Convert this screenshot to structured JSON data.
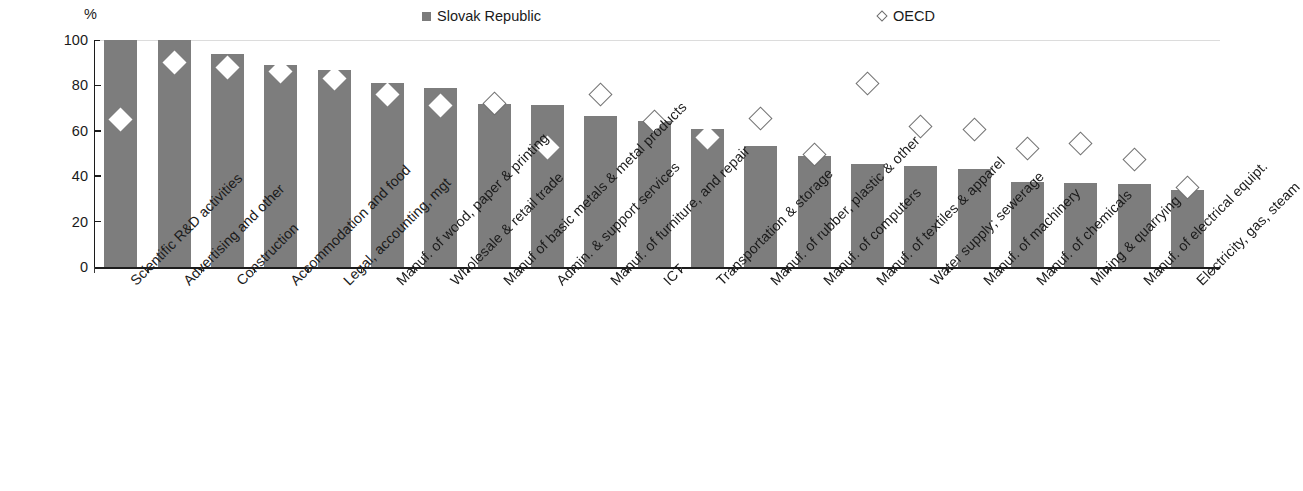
{
  "unit_label": "%",
  "legend": {
    "series1": "Slovak Republic",
    "series2": "OECD"
  },
  "colors": {
    "bar": "#7d7d7d",
    "marker_fill": "#ffffff",
    "marker_stroke": "#6a6a6a",
    "axis": "#1c1c1c",
    "grid": "#dcdcdc"
  },
  "chart_data": {
    "type": "bar",
    "title": "",
    "subtitle": "",
    "xlabel": "",
    "ylabel": "%",
    "ylim": [
      0,
      100
    ],
    "yticks": [
      0,
      20,
      40,
      60,
      80,
      100
    ],
    "grid": true,
    "legend_position": "top",
    "categories": [
      "Scientific R&D activities",
      "Advertising and other",
      "Construction",
      "Accommodation and food",
      "Legal, accounting, mgt",
      "Manuf. of wood, paper & printing",
      "Wholesale & retail trade",
      "Manuf of basic metals & metal products",
      "Admin. & support services",
      "Manuf. of furniture, and repair",
      "ICT",
      "Transportation & storage",
      "Manuf. of rubber, plastic & other",
      "Manuf. of computers",
      "Manuf. of textiles & apparel",
      "Water supply; sewerage",
      "Manuf. of machinery",
      "Manuf. of chemicals",
      "Mining & quarrying",
      "Manuf. of electrical equipt.",
      "Electricity, gas, steam"
    ],
    "series": [
      {
        "name": "Slovak Republic",
        "type": "bar",
        "values": [
          100,
          100,
          94,
          89,
          87,
          81,
          79,
          72,
          71.5,
          66.5,
          64.5,
          61,
          53.5,
          49,
          45.5,
          44.5,
          43,
          37.5,
          37,
          36.5,
          34
        ]
      },
      {
        "name": "OECD",
        "type": "marker",
        "values": [
          65,
          90,
          88,
          86,
          83,
          76,
          71,
          72,
          52.5,
          76,
          64,
          57,
          65.5,
          49.5,
          81,
          62,
          60.5,
          52,
          54.5,
          47.5,
          35
        ]
      }
    ]
  }
}
